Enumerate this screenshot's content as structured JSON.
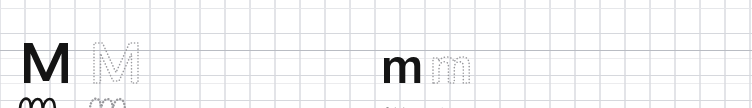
{
  "worksheet": {
    "type": "handwriting-practice-worksheet",
    "width": 752,
    "height": 108,
    "background_color": "#ffffff",
    "ink_color": "#141414",
    "trace_color": "#9a9a9e",
    "grid": {
      "cell_size": 25,
      "fine_line_color": "#ececee",
      "column_line_color": "#cfd2d8",
      "rule_colors": {
        "faint": "#e6e7ea",
        "medium": "#d6d8dd",
        "strong": "#b9bcc3"
      },
      "horizontal_rules_y": [
        8,
        33,
        50,
        75,
        100
      ]
    },
    "rows": [
      {
        "name": "row-uppercase-and-lowercase-print",
        "index": 0,
        "items": [
          {
            "name": "capital-m-solid",
            "letter": "M",
            "case": "uppercase",
            "style": "print",
            "render": "solid",
            "x": 23,
            "y": 10
          },
          {
            "name": "capital-m-dotted",
            "letter": "M",
            "case": "uppercase",
            "style": "print",
            "render": "dotted",
            "x": 93,
            "y": 10
          },
          {
            "name": "lowercase-m-solid",
            "letter": "m",
            "case": "lowercase",
            "style": "print",
            "render": "solid",
            "x": 383,
            "y": 24
          },
          {
            "name": "lowercase-m-dotted",
            "letter": "m",
            "case": "lowercase",
            "style": "print",
            "render": "dotted",
            "x": 432,
            "y": 24
          }
        ]
      },
      {
        "name": "row-cursive",
        "index": 1,
        "items": [
          {
            "name": "cursive-m-solid-left",
            "letter": "m",
            "case": "lowercase",
            "style": "cursive",
            "render": "solid",
            "x": 18,
            "y": 62
          },
          {
            "name": "cursive-m-dotted-left",
            "letter": "m",
            "case": "lowercase",
            "style": "cursive",
            "render": "dotted",
            "x": 88,
            "y": 62
          },
          {
            "name": "cursive-m-solid-right",
            "letter": "m",
            "case": "lowercase",
            "style": "cursive",
            "render": "solid",
            "x": 382,
            "y": 74
          },
          {
            "name": "cursive-m-dotted-right",
            "letter": "m",
            "case": "lowercase",
            "style": "cursive",
            "render": "dotted",
            "x": 436,
            "y": 74
          }
        ]
      }
    ]
  }
}
